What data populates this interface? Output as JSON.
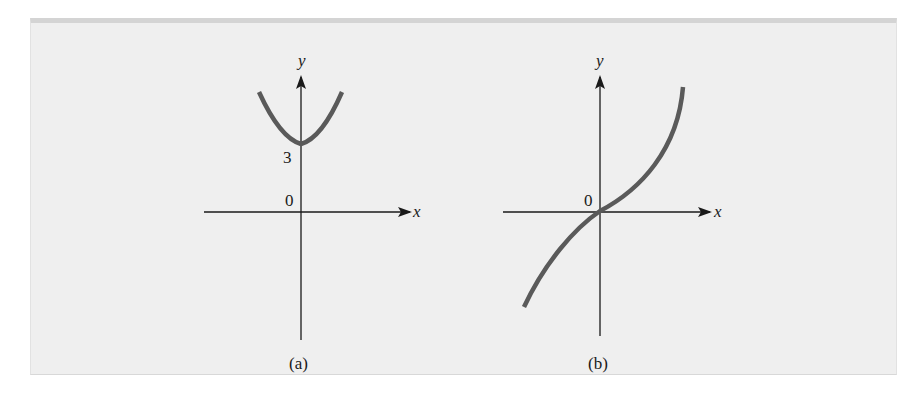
{
  "colors": {
    "panel_bg": "#efefef",
    "axis": "#1a1a1a",
    "curve": "#5a5a5a"
  },
  "figure": {
    "panels": [
      {
        "id": "a",
        "caption": "(a)",
        "x_label": "x",
        "y_label": "y",
        "origin_label": "0",
        "y_intercept_label": "3",
        "curve": "upward parabola, vertex at (0, 3)"
      },
      {
        "id": "b",
        "caption": "(b)",
        "x_label": "x",
        "y_label": "y",
        "origin_label": "0",
        "curve": "increasing curve passing through origin with inflection at origin"
      }
    ]
  }
}
